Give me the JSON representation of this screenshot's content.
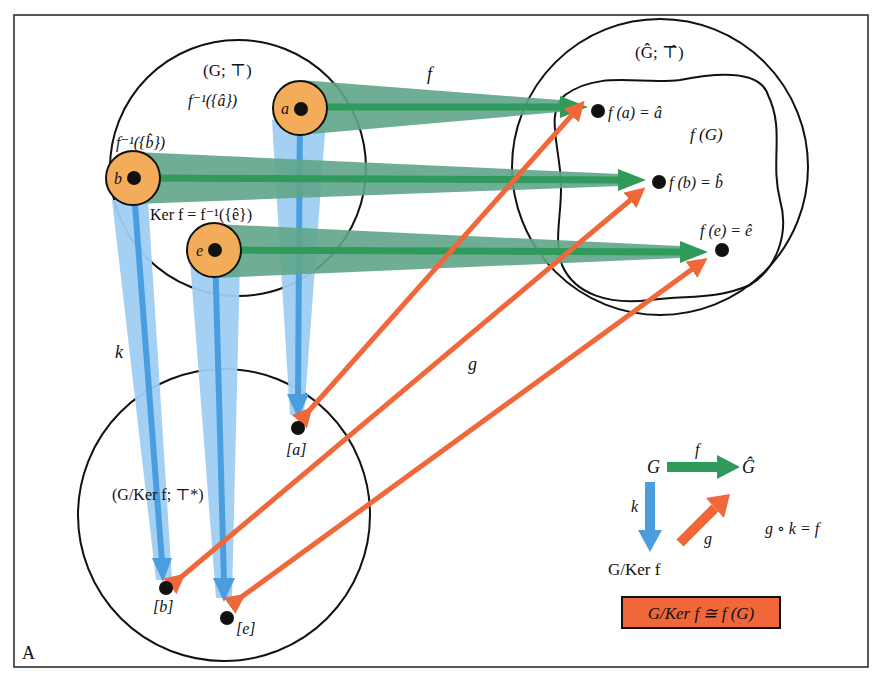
{
  "panel_label": "A",
  "colors": {
    "green_band": "#5fa58a",
    "green_core": "#2f9a5a",
    "blue_band": "#9fcdf2",
    "blue_core": "#4a9ee0",
    "orange": "#f0673a",
    "coset_fill": "#f3ad5a",
    "box_fill": "#f0673a",
    "stroke": "#111111"
  },
  "domain_set": {
    "label": "(G; ⊤)",
    "preimage_a": "f⁻¹({â})",
    "preimage_b": "f⁻¹({b̂})",
    "kernel": "Ker f = f⁻¹({ê})",
    "points": [
      "a",
      "b",
      "e"
    ]
  },
  "codomain_set": {
    "label": "(Ĝ; ⊤̂)",
    "image_label": "f (G)",
    "points": [
      "f (a) = â",
      "f (b) = b̂",
      "f (e) = ê"
    ]
  },
  "quotient_set": {
    "label": "(G/Ker f; ⊤*)",
    "points": [
      "[a]",
      "[b]",
      "[e]"
    ]
  },
  "maps": {
    "f": "f",
    "k": "k",
    "g": "g"
  },
  "commutative_diagram": {
    "G": "G",
    "G_hat": "Ĝ",
    "quotient": "G/Ker f",
    "f": "f",
    "k": "k",
    "g": "g",
    "equation": "g ∘ k = f"
  },
  "theorem_box": "G/Ker f ≅ f (G)"
}
